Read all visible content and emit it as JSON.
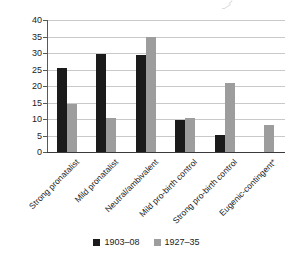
{
  "chart_data": {
    "type": "bar",
    "title": "",
    "subtitle": "",
    "xlabel": "",
    "ylabel": "",
    "ylim": [
      0,
      40
    ],
    "yticks": [
      0,
      5,
      10,
      15,
      20,
      25,
      30,
      35,
      40
    ],
    "ytick_labels": [
      "0",
      "5",
      "10",
      "15",
      "20",
      "25",
      "30",
      "35",
      "40"
    ],
    "grid": true,
    "legend_position": "bottom",
    "categories": [
      "Strong pronatalist",
      "Mild pronatalist",
      "Neutral/ambivalent",
      "Mild pro-birth control",
      "Strong pro-birth control",
      "Eugenic-contingent*"
    ],
    "series": [
      {
        "name": "1903–08",
        "color": "#1b1b1b",
        "values": [
          25.5,
          29.8,
          29.3,
          9.8,
          5.2,
          0
        ]
      },
      {
        "name": "1927–35",
        "color": "#9d9d9d",
        "values": [
          14.5,
          10.3,
          35.0,
          10.4,
          20.8,
          8.1
        ]
      }
    ],
    "annotations": []
  },
  "legend": {
    "items": [
      {
        "label": "1903–08",
        "swatch": "series-1-swatch"
      },
      {
        "label": "1927–35",
        "swatch": "series-2-swatch"
      }
    ]
  },
  "colors": {
    "series_1": "#1b1b1b",
    "series_2": "#9d9d9d",
    "gridline": "#c9c9c9",
    "axis": "#3a3a3c",
    "text": "#1c1c1c",
    "background": "#ffffff"
  }
}
